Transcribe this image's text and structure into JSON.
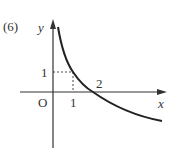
{
  "problem_label": "(6)",
  "axes": {
    "x_label": "x",
    "y_label": "y",
    "origin_label": "O"
  },
  "ticks": {
    "x_tick": "1",
    "y_tick": "1",
    "x_intercept_label": "2"
  },
  "curve": {
    "description": "decreasing curve passing through (1,1) and (2,0)",
    "points": [
      [
        0.3,
        3.6
      ],
      [
        1,
        1
      ],
      [
        2,
        0
      ],
      [
        5,
        -1.4
      ]
    ]
  },
  "colors": {
    "ink": "#333333",
    "background": "#ffffff"
  }
}
